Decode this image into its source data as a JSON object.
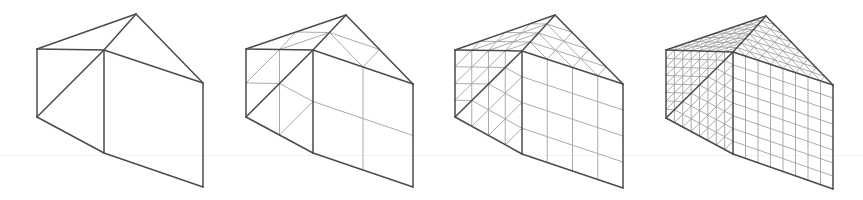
{
  "figure": {
    "colors": {
      "edge_bold": "#4a4a4a",
      "edge_thin": "#a2a2a2",
      "background": "#ffffff"
    },
    "panels": [
      {
        "id": "level-1",
        "subdivisions": 1,
        "vertices": {
          "TL": [
            37,
            49
          ],
          "TM": [
            104,
            50
          ],
          "A": [
            136,
            14
          ],
          "RT": [
            203,
            83
          ],
          "BL": [
            37,
            117
          ],
          "BM": [
            104,
            153
          ],
          "BR": [
            203,
            187
          ]
        }
      },
      {
        "id": "level-2",
        "subdivisions": 2,
        "vertices": {
          "TL": [
            246,
            49
          ],
          "TM": [
            313,
            50
          ],
          "A": [
            346,
            15
          ],
          "RT": [
            413,
            84
          ],
          "BL": [
            246,
            117
          ],
          "BM": [
            313,
            153
          ],
          "BR": [
            413,
            187
          ]
        }
      },
      {
        "id": "level-3",
        "subdivisions": 4,
        "vertices": {
          "TL": [
            455,
            50
          ],
          "TM": [
            522,
            51
          ],
          "A": [
            555,
            15
          ],
          "RT": [
            623,
            84
          ],
          "BL": [
            455,
            117
          ],
          "BM": [
            522,
            154
          ],
          "BR": [
            623,
            188
          ]
        }
      },
      {
        "id": "level-4",
        "subdivisions": 8,
        "vertices": {
          "TL": [
            666,
            50
          ],
          "TM": [
            733,
            52
          ],
          "A": [
            766,
            16
          ],
          "RT": [
            833,
            85
          ],
          "BL": [
            666,
            118
          ],
          "BM": [
            733,
            154
          ],
          "BR": [
            833,
            189
          ]
        }
      }
    ],
    "faces": {
      "triangles": [
        [
          "TL",
          "A",
          "TM"
        ],
        [
          "TM",
          "A",
          "RT"
        ],
        [
          "TL",
          "TM",
          "BL"
        ],
        [
          "TM",
          "BM",
          "BL"
        ]
      ],
      "quads": [
        [
          "TM",
          "RT",
          "BR",
          "BM"
        ]
      ]
    },
    "outline_edges": [
      [
        "TL",
        "A"
      ],
      [
        "A",
        "RT"
      ],
      [
        "TL",
        "TM"
      ],
      [
        "TM",
        "A"
      ],
      [
        "TM",
        "RT"
      ],
      [
        "TL",
        "BL"
      ],
      [
        "TM",
        "BM"
      ],
      [
        "RT",
        "BR"
      ],
      [
        "BL",
        "BM"
      ],
      [
        "BM",
        "BR"
      ],
      [
        "TM",
        "BL"
      ]
    ]
  }
}
